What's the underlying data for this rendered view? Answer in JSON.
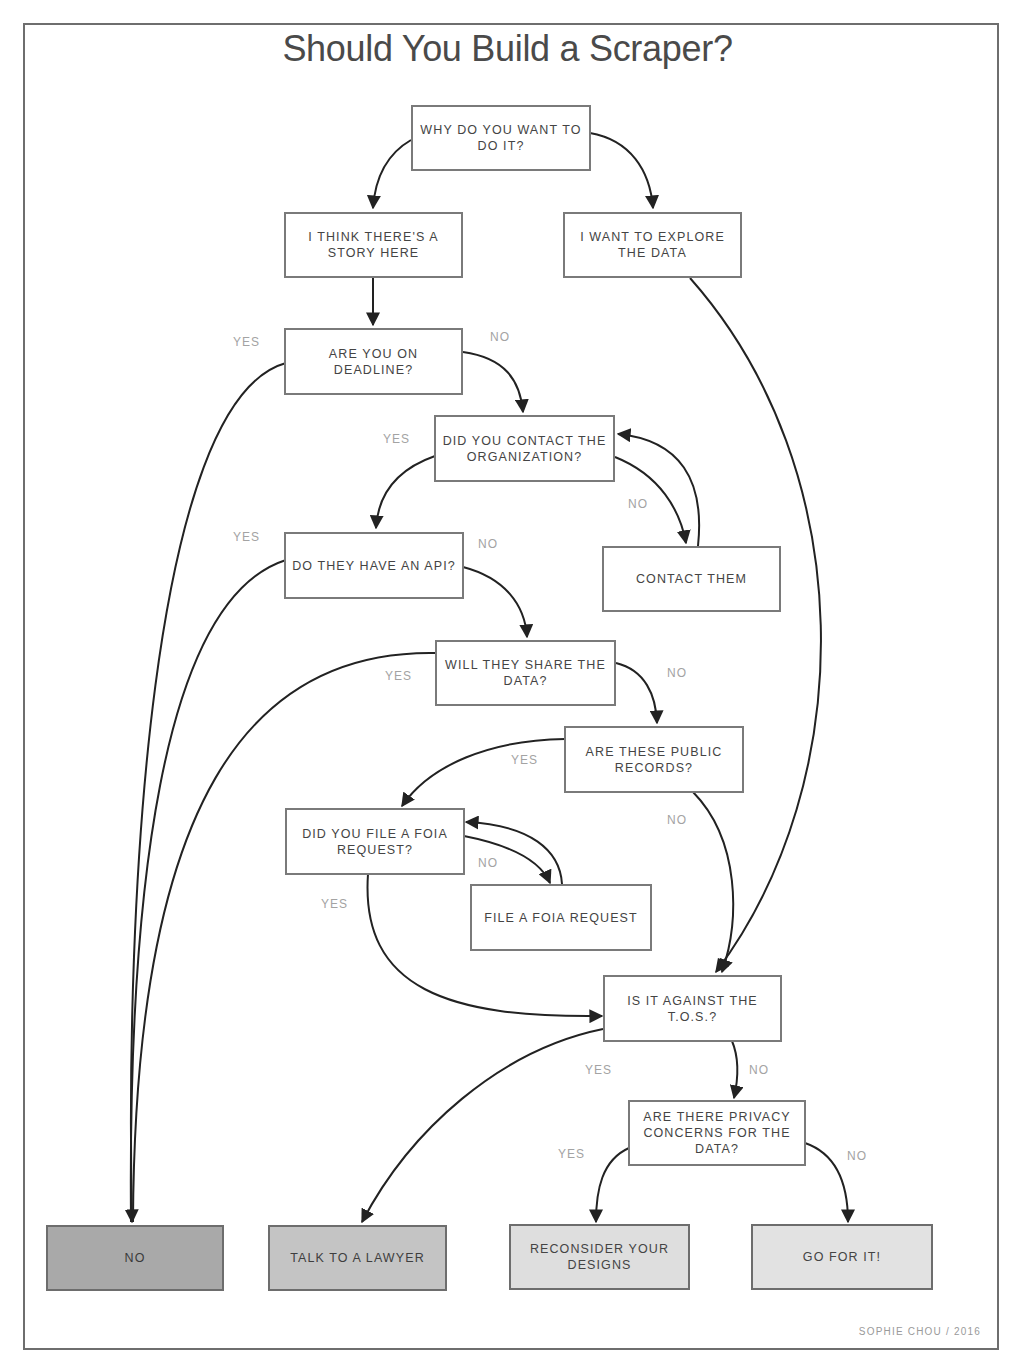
{
  "title": "Should You Build a Scraper?",
  "credit": "SOPHIE CHOU / 2016",
  "colors": {
    "frame": "#6e6e6e",
    "box_border": "#7a7a7a",
    "text": "#444444",
    "label": "#a3a3a3",
    "arrow": "#222222",
    "outcome_no": "#a9a9a9",
    "outcome_lawyer": "#c4c4c4",
    "outcome_reconsider": "#dedede",
    "outcome_go": "#e2e2e2"
  },
  "nodes": {
    "why": {
      "text": "WHY DO YOU WANT TO DO IT?"
    },
    "story": {
      "text": "I THINK THERE'S A STORY HERE"
    },
    "explore": {
      "text": "I WANT TO EXPLORE THE DATA"
    },
    "deadline": {
      "text": "ARE YOU ON DEADLINE?"
    },
    "contact_org": {
      "text": "DID YOU CONTACT THE ORGANIZATION?"
    },
    "contact_them": {
      "text": "CONTACT THEM"
    },
    "api": {
      "text": "DO THEY HAVE AN API?"
    },
    "share": {
      "text": "WILL THEY SHARE THE DATA?"
    },
    "public": {
      "text": "ARE THESE PUBLIC RECORDS?"
    },
    "foia_q": {
      "text": "DID YOU FILE A FOIA REQUEST?"
    },
    "foia_file": {
      "text": "FILE A FOIA REQUEST"
    },
    "tos": {
      "text": "IS IT AGAINST THE T.O.S.?"
    },
    "privacy": {
      "text": "ARE THERE PRIVACY CONCERNS FOR THE DATA?"
    }
  },
  "outcomes": {
    "no": {
      "text": "NO"
    },
    "lawyer": {
      "text": "TALK TO A LAWYER"
    },
    "reconsider": {
      "text": "RECONSIDER YOUR DESIGNS"
    },
    "go": {
      "text": "GO FOR IT!"
    }
  },
  "labels": {
    "deadline_yes": "YES",
    "deadline_no": "NO",
    "contact_yes": "YES",
    "contact_no": "NO",
    "api_yes": "YES",
    "api_no": "NO",
    "share_yes": "YES",
    "share_no": "NO",
    "public_yes": "YES",
    "public_no": "NO",
    "foia_no": "NO",
    "foia_yes": "YES",
    "tos_yes": "YES",
    "tos_no": "NO",
    "privacy_yes": "YES",
    "privacy_no": "NO"
  }
}
